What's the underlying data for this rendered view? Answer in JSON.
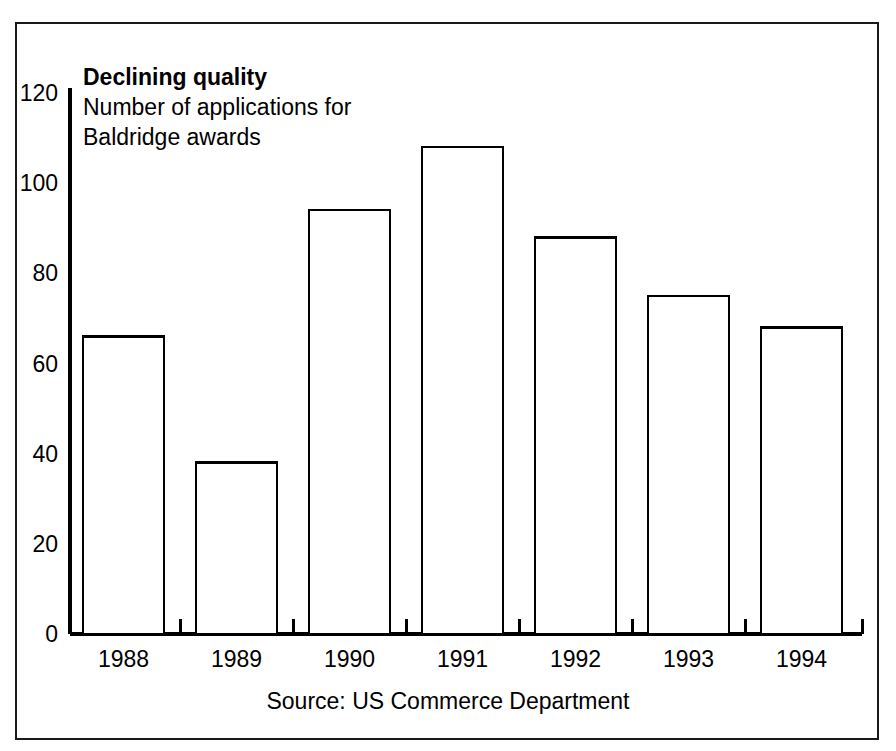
{
  "chart_data": {
    "type": "bar",
    "title": "Declining quality",
    "subtitle_lines": [
      "Number of applications for",
      "Baldridge awards"
    ],
    "categories": [
      "1988",
      "1989",
      "1990",
      "1991",
      "1992",
      "1993",
      "1994"
    ],
    "values": [
      66,
      38,
      94,
      108,
      88,
      75,
      68
    ],
    "xlabel": "",
    "ylabel": "",
    "ylim": [
      0,
      120
    ],
    "yticks": [
      0,
      20,
      40,
      60,
      80,
      100,
      120
    ],
    "ytick_labels": [
      "0",
      "20",
      "40",
      "60",
      "80",
      "100",
      "120"
    ],
    "grid": false,
    "legend": false,
    "bar_fill": "#ffffff",
    "bar_edge": "#000000",
    "source_note": "Source: US Commerce Department"
  },
  "figure": {
    "background": "#ffffff",
    "frame_color": "#1a1a1a"
  }
}
